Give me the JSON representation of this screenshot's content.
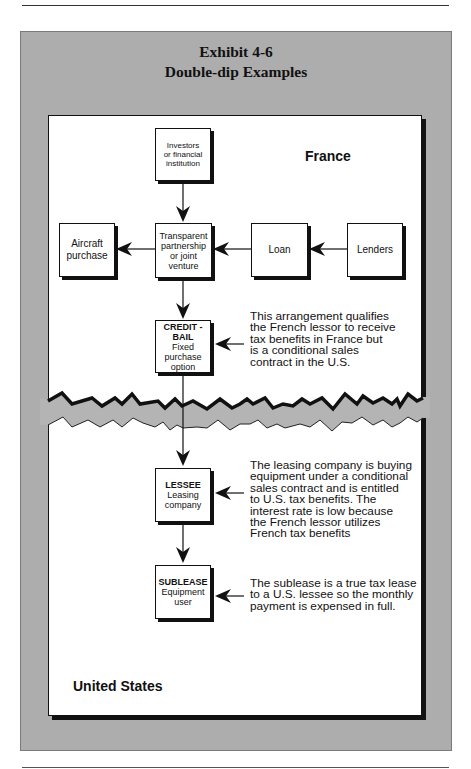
{
  "exhibit": {
    "number": "Exhibit 4-6",
    "title": "Double-dip Examples"
  },
  "regions": {
    "top": "France",
    "bottom": "United States"
  },
  "nodes": {
    "investors": {
      "title": "",
      "sub": "Investors\nor financial\ninstitution"
    },
    "aircraft": {
      "title": "",
      "sub": "Aircraft\npurchase"
    },
    "transparent": {
      "title": "",
      "sub": "Transparent\npartnership\nor joint\nventure"
    },
    "loan": {
      "title": "",
      "sub": "Loan"
    },
    "lenders": {
      "title": "",
      "sub": "Lenders"
    },
    "credit_bail": {
      "title": "CREDIT -\nBAIL",
      "sub": "Fixed\npurchase\noption"
    },
    "lessee": {
      "title": "LESSEE",
      "sub": "Leasing\ncompany"
    },
    "sublease": {
      "title": "SUBLEASE",
      "sub": "Equipment\nuser"
    }
  },
  "notes": {
    "credit_bail": [
      "This arrangement qualifies",
      "the French lessor to receive",
      "tax benefits in France but",
      "is a conditional sales",
      "contract in the U.S."
    ],
    "lessee": [
      "The leasing company is buying",
      "equipment under a conditional",
      "sales contract and is entitled",
      "to U.S. tax benefits.  The",
      "interest rate is low because",
      "the French lessor utilizes",
      "French tax benefits"
    ],
    "sublease": [
      "The sublease is a true tax lease",
      "to a U.S. lessee so the monthly",
      "payment is expensed in full."
    ]
  },
  "edges": [
    {
      "from": "investors",
      "to": "transparent"
    },
    {
      "from": "lenders",
      "to": "loan"
    },
    {
      "from": "loan",
      "to": "transparent"
    },
    {
      "from": "transparent",
      "to": "aircraft"
    },
    {
      "from": "transparent",
      "to": "credit_bail"
    },
    {
      "from": "credit_bail",
      "to": "lessee"
    },
    {
      "from": "lessee",
      "to": "sublease"
    }
  ],
  "colors": {
    "panel": "#adadad",
    "border_break": "#b4b4b4",
    "ink": "#111111"
  }
}
